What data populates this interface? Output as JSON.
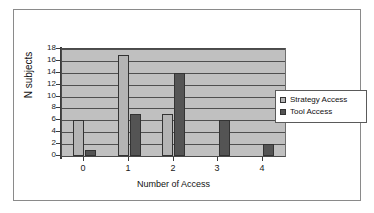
{
  "chart_data": {
    "type": "bar",
    "title": "",
    "xlabel": "Number of Access",
    "ylabel": "N subjects",
    "categories": [
      "0",
      "1",
      "2",
      "3",
      "4"
    ],
    "series": [
      {
        "name": "Strategy Access",
        "color": "#b4b4b4",
        "values": [
          6,
          17,
          7,
          0,
          0
        ]
      },
      {
        "name": "Tool Access",
        "color": "#545454",
        "values": [
          1,
          7,
          14,
          6,
          2
        ]
      }
    ],
    "ylim": [
      0,
      18
    ],
    "ytick_labels": [
      "0",
      "2",
      "4",
      "6",
      "8",
      "10",
      "12",
      "14",
      "16",
      "18"
    ],
    "yticks": [
      0,
      2,
      4,
      6,
      8,
      10,
      12,
      14,
      16,
      18
    ],
    "grid": true,
    "legend_position": "right",
    "plot_background": "#c0c0c0",
    "frame_border": "#8a8a8a"
  },
  "legend": {
    "entries": [
      {
        "label": "Strategy Access"
      },
      {
        "label": "Tool Access"
      }
    ]
  },
  "axes": {
    "y_title": "N subjects",
    "x_title": "Number of Access"
  }
}
